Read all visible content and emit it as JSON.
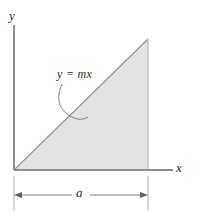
{
  "figure": {
    "background_color": "#ffffff",
    "axes": {
      "y_axis_label": "y",
      "x_axis_label": "x",
      "axis_color": "#8a8a8a",
      "origin_x": 14,
      "origin_y": 170
    },
    "region": {
      "name": "shaded-triangle",
      "fill_color": "#e3e3e3",
      "edge_color": "#8f8f8f",
      "vertices": [
        {
          "x": 14,
          "y": 170
        },
        {
          "x": 148,
          "y": 170
        },
        {
          "x": 148,
          "y": 39
        }
      ]
    },
    "equation_label": {
      "text": "y = mx",
      "leader_line": "curved-arc-to-hypotenuse"
    },
    "dimension": {
      "label": "a",
      "from_x": 14,
      "to_x": 148,
      "line_y": 195,
      "style": "double-headed-arrow",
      "color": "#6f6f6f"
    }
  }
}
